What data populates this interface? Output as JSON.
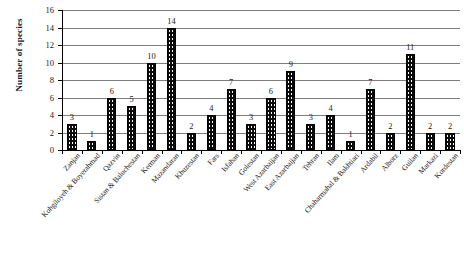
{
  "chart_data": {
    "type": "bar",
    "title": "",
    "xlabel": "",
    "ylabel": "Number of species",
    "ylim": [
      0,
      16
    ],
    "ytick_step": 2,
    "yticks": [
      0,
      2,
      4,
      6,
      8,
      10,
      12,
      14,
      16
    ],
    "grid": true,
    "grid_axis": "y",
    "legend": false,
    "bar_color": "#0b0b0b",
    "bar_pattern": "fine-dotted",
    "data_labels": true,
    "categories": [
      "Zanjan",
      "Kohgiloyeh & Boyerahmad",
      "Qazvin",
      "Sistan & Baluchestan",
      "Kerman",
      "Mazandaran",
      "Khuzestan",
      "Fars",
      "Isfahan",
      "Golestan",
      "West Azarbaijan",
      "East Azarbaijan",
      "Tehran",
      "Ilam",
      "Chaharmahal & Bakhtiari",
      "Ardabil",
      "Alborz",
      "Guilan",
      "Markazi",
      "Kordestan"
    ],
    "values": [
      3,
      1,
      6,
      5,
      10,
      14,
      2,
      4,
      7,
      3,
      6,
      9,
      3,
      4,
      1,
      7,
      2,
      11,
      2,
      2
    ]
  },
  "axis": {
    "y_title": "Number of species"
  }
}
